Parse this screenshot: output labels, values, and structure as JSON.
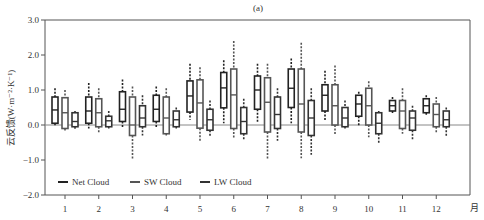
{
  "chart_data": {
    "type": "box",
    "title": "(a)",
    "xlabel": "月",
    "ylabel": "云反馈(W·m⁻²·K⁻¹)",
    "ylim": [
      -2.0,
      3.0
    ],
    "yticks": [
      "3.0",
      "2.0",
      "1.0",
      "0.0",
      "-1.0",
      "-2.0"
    ],
    "categories": [
      "1",
      "2",
      "3",
      "4",
      "5",
      "6",
      "7",
      "8",
      "9",
      "10",
      "11",
      "12"
    ],
    "legend": [
      "Net Cloud",
      "SW Cloud",
      "LW Cloud"
    ],
    "series": [
      {
        "name": "Net Cloud",
        "color": "#222222",
        "boxes": [
          {
            "wlo": -0.05,
            "q1": 0.05,
            "med": 0.43,
            "q3": 0.8,
            "whi": 1.05
          },
          {
            "wlo": -0.1,
            "q1": 0.05,
            "med": 0.4,
            "q3": 0.8,
            "whi": 1.2
          },
          {
            "wlo": -0.1,
            "q1": 0.1,
            "med": 0.45,
            "q3": 0.95,
            "whi": 1.3
          },
          {
            "wlo": -0.1,
            "q1": 0.1,
            "med": 0.45,
            "q3": 0.85,
            "whi": 1.1
          },
          {
            "wlo": 0.15,
            "q1": 0.37,
            "med": 0.83,
            "q3": 1.26,
            "whi": 1.75
          },
          {
            "wlo": 0.05,
            "q1": 0.49,
            "med": 1.06,
            "q3": 1.5,
            "whi": 1.85
          },
          {
            "wlo": 0.05,
            "q1": 0.45,
            "med": 1.0,
            "q3": 1.4,
            "whi": 1.75
          },
          {
            "wlo": 0.05,
            "q1": 0.5,
            "med": 1.05,
            "q3": 1.6,
            "whi": 1.9
          },
          {
            "wlo": 0.1,
            "q1": 0.4,
            "med": 0.85,
            "q3": 1.15,
            "whi": 1.55
          },
          {
            "wlo": -0.05,
            "q1": 0.25,
            "med": 0.6,
            "q3": 0.85,
            "whi": 0.95
          },
          {
            "wlo": 0.3,
            "q1": 0.4,
            "med": 0.55,
            "q3": 0.7,
            "whi": 0.8
          },
          {
            "wlo": 0.25,
            "q1": 0.35,
            "med": 0.55,
            "q3": 0.75,
            "whi": 0.85
          }
        ]
      },
      {
        "name": "SW Cloud",
        "color": "#555555",
        "boxes": [
          {
            "wlo": -0.2,
            "q1": -0.1,
            "med": 0.35,
            "q3": 0.78,
            "whi": 1.0
          },
          {
            "wlo": -0.25,
            "q1": -0.05,
            "med": 0.35,
            "q3": 0.75,
            "whi": 1.05
          },
          {
            "wlo": -1.0,
            "q1": -0.3,
            "med": 0.0,
            "q3": 0.8,
            "whi": 1.1
          },
          {
            "wlo": -0.3,
            "q1": -0.25,
            "med": 0.2,
            "q3": 0.8,
            "whi": 1.05
          },
          {
            "wlo": -0.45,
            "q1": -0.09,
            "med": 0.63,
            "q3": 1.29,
            "whi": 1.65
          },
          {
            "wlo": -0.4,
            "q1": -0.1,
            "med": 0.86,
            "q3": 1.6,
            "whi": 2.4
          },
          {
            "wlo": -1.0,
            "q1": -0.2,
            "med": 0.65,
            "q3": 1.35,
            "whi": 1.75
          },
          {
            "wlo": -0.95,
            "q1": -0.2,
            "med": 0.6,
            "q3": 1.6,
            "whi": 2.35
          },
          {
            "wlo": -0.3,
            "q1": 0.0,
            "med": 0.55,
            "q3": 1.15,
            "whi": 1.7
          },
          {
            "wlo": -0.35,
            "q1": 0.0,
            "med": 0.55,
            "q3": 1.05,
            "whi": 1.25
          },
          {
            "wlo": -0.25,
            "q1": -0.1,
            "med": 0.4,
            "q3": 0.7,
            "whi": 1.05
          },
          {
            "wlo": -0.25,
            "q1": -0.05,
            "med": 0.3,
            "q3": 0.6,
            "whi": 0.8
          }
        ]
      },
      {
        "name": "LW Cloud",
        "color": "#333333",
        "boxes": [
          {
            "wlo": -0.15,
            "q1": -0.05,
            "med": 0.1,
            "q3": 0.35,
            "whi": 0.4
          },
          {
            "wlo": -0.1,
            "q1": -0.05,
            "med": 0.12,
            "q3": 0.25,
            "whi": 0.4
          },
          {
            "wlo": -0.3,
            "q1": -0.05,
            "med": 0.2,
            "q3": 0.55,
            "whi": 0.85
          },
          {
            "wlo": -0.1,
            "q1": -0.05,
            "med": 0.15,
            "q3": 0.4,
            "whi": 0.5
          },
          {
            "wlo": -0.35,
            "q1": -0.15,
            "med": 0.15,
            "q3": 0.45,
            "whi": 0.7
          },
          {
            "wlo": -0.45,
            "q1": -0.25,
            "med": 0.1,
            "q3": 0.5,
            "whi": 0.75
          },
          {
            "wlo": -0.45,
            "q1": -0.1,
            "med": 0.3,
            "q3": 0.8,
            "whi": 1.05
          },
          {
            "wlo": -0.85,
            "q1": -0.3,
            "med": 0.2,
            "q3": 0.7,
            "whi": 1.05
          },
          {
            "wlo": -0.1,
            "q1": -0.05,
            "med": 0.2,
            "q3": 0.5,
            "whi": 0.7
          },
          {
            "wlo": -0.55,
            "q1": -0.25,
            "med": 0.05,
            "q3": 0.35,
            "whi": 0.4
          },
          {
            "wlo": -0.45,
            "q1": -0.15,
            "med": 0.2,
            "q3": 0.4,
            "whi": 0.55
          },
          {
            "wlo": -0.35,
            "q1": -0.05,
            "med": 0.15,
            "q3": 0.4,
            "whi": 0.5
          }
        ]
      }
    ]
  }
}
